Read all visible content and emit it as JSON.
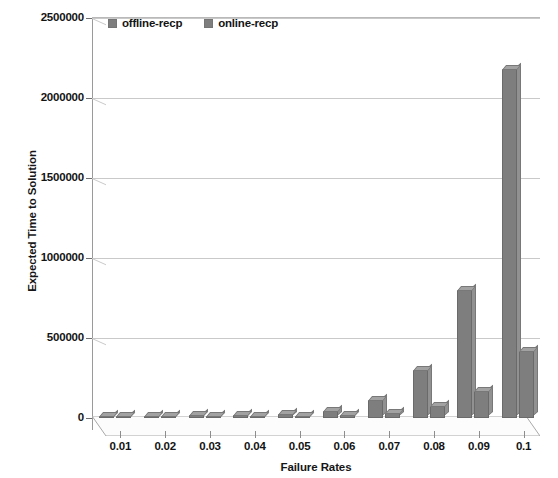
{
  "chart_data": {
    "type": "bar",
    "title": "",
    "xlabel": "Failure Rates",
    "ylabel": "Expected Time to Solution",
    "categories": [
      "0.01",
      "0.02",
      "0.03",
      "0.04",
      "0.05",
      "0.06",
      "0.07",
      "0.08",
      "0.09",
      "0.1"
    ],
    "series": [
      {
        "name": "offline-recp",
        "color": "#7e7e7e",
        "values": [
          12000,
          14000,
          17000,
          20000,
          25000,
          45000,
          110000,
          300000,
          800000,
          2180000
        ]
      },
      {
        "name": "online-recp",
        "color": "#7e7e7e",
        "values": [
          8000,
          9000,
          10000,
          11000,
          13000,
          20000,
          30000,
          75000,
          170000,
          420000
        ]
      }
    ],
    "ylim": [
      0,
      2500000
    ],
    "yticks": [
      0,
      500000,
      1000000,
      1500000,
      2000000,
      2500000
    ],
    "ytick_labels": [
      "0",
      "500000",
      "1000000",
      "1500000",
      "2000000",
      "2500000"
    ],
    "grid": true,
    "legend_position": "top-left",
    "style": "3d-bar",
    "background": "#ffffff",
    "gridline_color": "#c9c9c9",
    "axis_color": "#9a9a9a"
  }
}
